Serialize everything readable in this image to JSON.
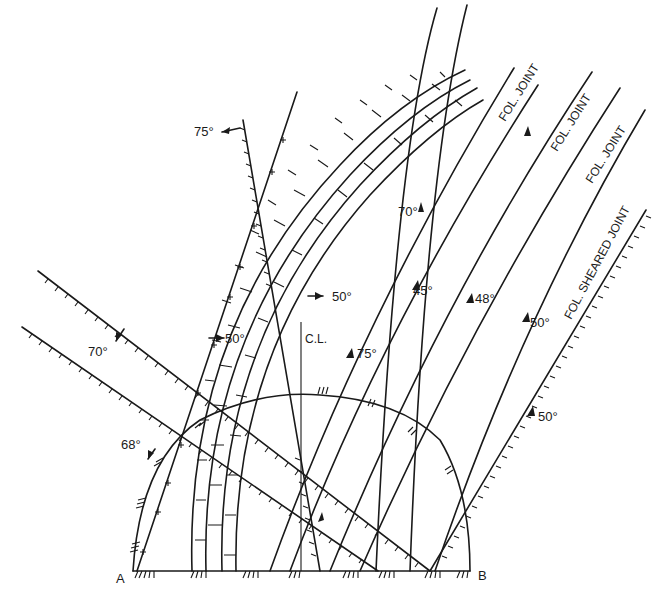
{
  "diagram": {
    "type": "geological-section",
    "colors": {
      "ink": "#1a1a1a",
      "background": "#ffffff"
    },
    "points": {
      "A": "A",
      "B": "B"
    },
    "centerline_label": "C.L.",
    "joint_labels": [
      {
        "id": "j1",
        "text": "FOL. JOINT"
      },
      {
        "id": "j2",
        "text": "FOL. JOINT"
      },
      {
        "id": "j3",
        "text": "FOL. JOINT"
      },
      {
        "id": "j4",
        "text": "FOL. SHEARED JOINT"
      }
    ],
    "dip_labels": [
      {
        "id": "d75a",
        "text": "75°"
      },
      {
        "id": "d70a",
        "text": "70°"
      },
      {
        "id": "d68",
        "text": "68°"
      },
      {
        "id": "d50a",
        "text": "50°"
      },
      {
        "id": "d50b",
        "text": "50°"
      },
      {
        "id": "d75b",
        "text": "75°"
      },
      {
        "id": "d70b",
        "text": "70°"
      },
      {
        "id": "d45",
        "text": "45°"
      },
      {
        "id": "d48",
        "text": "48°"
      },
      {
        "id": "d50c",
        "text": "50°"
      },
      {
        "id": "d50d",
        "text": "50°"
      }
    ]
  }
}
